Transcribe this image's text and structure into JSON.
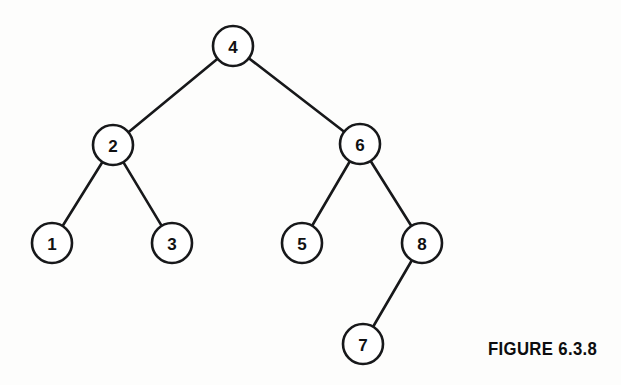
{
  "figure": {
    "caption": "FIGURE 6.3.8",
    "background_color": "#fdfdfc",
    "ink_color": "#17181a"
  },
  "chart_data": {
    "type": "diagram",
    "diagram_type": "binary-search-tree",
    "title": "FIGURE 6.3.8",
    "node_radius": 20,
    "nodes": [
      {
        "id": "n4",
        "label": "4",
        "x": 233,
        "y": 46,
        "depth": 0
      },
      {
        "id": "n2",
        "label": "2",
        "x": 113,
        "y": 145,
        "depth": 1
      },
      {
        "id": "n6",
        "label": "6",
        "x": 360,
        "y": 144,
        "depth": 1
      },
      {
        "id": "n1",
        "label": "1",
        "x": 52,
        "y": 243,
        "depth": 2
      },
      {
        "id": "n3",
        "label": "3",
        "x": 172,
        "y": 243,
        "depth": 2
      },
      {
        "id": "n5",
        "label": "5",
        "x": 302,
        "y": 243,
        "depth": 2
      },
      {
        "id": "n8",
        "label": "8",
        "x": 422,
        "y": 243,
        "depth": 2
      },
      {
        "id": "n7",
        "label": "7",
        "x": 363,
        "y": 344,
        "depth": 3
      }
    ],
    "edges": [
      {
        "from": "n4",
        "to": "n2",
        "side": "left"
      },
      {
        "from": "n4",
        "to": "n6",
        "side": "right"
      },
      {
        "from": "n2",
        "to": "n1",
        "side": "left"
      },
      {
        "from": "n2",
        "to": "n3",
        "side": "right"
      },
      {
        "from": "n6",
        "to": "n5",
        "side": "left"
      },
      {
        "from": "n6",
        "to": "n8",
        "side": "right"
      },
      {
        "from": "n8",
        "to": "n7",
        "side": "left"
      }
    ]
  }
}
